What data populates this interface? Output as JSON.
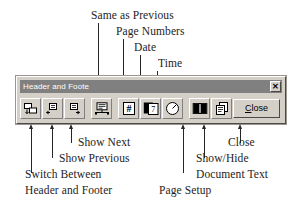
{
  "diagram": {
    "top_labels": [
      {
        "text": "Same as Previous",
        "target_icon": "same-as-previous"
      },
      {
        "text": "Page Numbers",
        "target_icon": "page-numbers"
      },
      {
        "text": "Date",
        "target_icon": "insert-date"
      },
      {
        "text": "Time",
        "target_icon": "insert-time"
      }
    ],
    "bottom_labels": [
      {
        "text": "Show Next",
        "target_icon": "show-next"
      },
      {
        "text": "Show Previous",
        "target_icon": "show-previous"
      },
      {
        "text": "Switch Between",
        "target_icon": "switch-header-footer"
      },
      {
        "text": "Header and Footer",
        "target_icon": "switch-header-footer"
      },
      {
        "text": "Close",
        "target_icon": "close-button"
      },
      {
        "text": "Show/Hide",
        "target_icon": "show-hide-document-text"
      },
      {
        "text": "Document Text",
        "target_icon": "show-hide-document-text"
      },
      {
        "text": "Page Setup",
        "target_icon": "page-setup"
      }
    ]
  },
  "toolbar": {
    "title": "Header and Foote",
    "close_x_glyph": "✕",
    "close_button_label_underlined": "C",
    "close_button_label_rest": "lose",
    "buttons": [
      {
        "name": "switch-header-footer",
        "tooltip": "Switch Between Header and Footer"
      },
      {
        "name": "show-previous",
        "tooltip": "Show Previous"
      },
      {
        "name": "show-next",
        "tooltip": "Show Next"
      },
      {
        "name": "same-as-previous",
        "tooltip": "Same as Previous"
      },
      {
        "name": "page-numbers",
        "tooltip": "Insert Page Number"
      },
      {
        "name": "insert-date",
        "tooltip": "Insert Date"
      },
      {
        "name": "insert-time",
        "tooltip": "Insert Time"
      },
      {
        "name": "page-setup",
        "tooltip": "Page Setup"
      },
      {
        "name": "show-hide-document-text",
        "tooltip": "Show/Hide Document Text"
      }
    ]
  },
  "colors": {
    "toolbar_face": "#d4d0c8",
    "titlebar": "#808080",
    "ink": "#1c1c1c",
    "page_background": "#ffffff"
  }
}
